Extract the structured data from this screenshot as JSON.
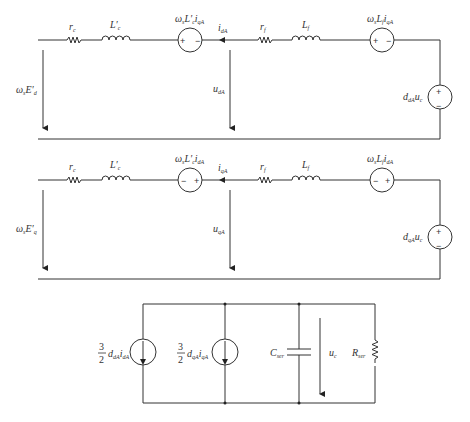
{
  "diagram": {
    "type": "circuit",
    "colors": {
      "stroke": "#333333",
      "background": "#ffffff"
    },
    "circuits": [
      {
        "id": "d-axis",
        "components": {
          "left_voltage_arrow": {
            "symbol": "ω",
            "sub": "s",
            "main": "E′",
            "main_sub": "d"
          },
          "resistor_c": {
            "symbol": "r",
            "sub": "c"
          },
          "inductor_c": {
            "symbol": "L′",
            "sub": "c"
          },
          "coupling_source": {
            "symbol": "ω",
            "sub": "s",
            "mid": "L′",
            "mid_sub": "c",
            "tail": "i",
            "tail_sub": "qA",
            "polarity_left": "+",
            "polarity_right": "−"
          },
          "current": {
            "symbol": "i",
            "sub": "dA"
          },
          "mid_voltage_arrow": {
            "symbol": "u",
            "sub": "dA"
          },
          "resistor_f": {
            "symbol": "r",
            "sub": "f"
          },
          "inductor_f": {
            "symbol": "L",
            "sub": "f"
          },
          "filter_source": {
            "symbol": "ω",
            "sub": "s",
            "mid": "L",
            "mid_sub": "f",
            "tail": "i",
            "tail_sub": "qA",
            "polarity_left": "+",
            "polarity_right": "−"
          },
          "converter_source": {
            "symbol": "d",
            "sub": "dA",
            "tail": "u",
            "tail_sub": "c",
            "polarity_top": "+",
            "polarity_bottom": "−"
          }
        }
      },
      {
        "id": "q-axis",
        "components": {
          "left_voltage_arrow": {
            "symbol": "ω",
            "sub": "s",
            "main": "E′",
            "main_sub": "q"
          },
          "resistor_c": {
            "symbol": "r",
            "sub": "c"
          },
          "inductor_c": {
            "symbol": "L′",
            "sub": "c"
          },
          "coupling_source": {
            "symbol": "ω",
            "sub": "s",
            "mid": "L′",
            "mid_sub": "c",
            "tail": "i",
            "tail_sub": "dA",
            "polarity_left": "−",
            "polarity_right": "+"
          },
          "current": {
            "symbol": "i",
            "sub": "qA"
          },
          "mid_voltage_arrow": {
            "symbol": "u",
            "sub": "qA"
          },
          "resistor_f": {
            "symbol": "r",
            "sub": "f"
          },
          "inductor_f": {
            "symbol": "L",
            "sub": "f"
          },
          "filter_source": {
            "symbol": "ω",
            "sub": "s",
            "mid": "L",
            "mid_sub": "f",
            "tail": "i",
            "tail_sub": "dA",
            "polarity_left": "−",
            "polarity_right": "+"
          },
          "converter_source": {
            "symbol": "d",
            "sub": "qA",
            "tail": "u",
            "tail_sub": "c",
            "polarity_top": "+",
            "polarity_bottom": "−"
          }
        }
      },
      {
        "id": "dc-side",
        "components": {
          "current_source_d": {
            "coef_num": "3",
            "coef_den": "2",
            "symbol": "d",
            "sub": "dA",
            "tail": "i",
            "tail_sub": "dA"
          },
          "current_source_q": {
            "coef_num": "3",
            "coef_den": "2",
            "symbol": "d",
            "sub": "qA",
            "tail": "i",
            "tail_sub": "qA"
          },
          "capacitor": {
            "symbol": "C",
            "sub": "ser"
          },
          "voltage_arrow": {
            "symbol": "u",
            "sub": "c"
          },
          "resistor": {
            "symbol": "R",
            "sub": "ser"
          }
        }
      }
    ]
  }
}
